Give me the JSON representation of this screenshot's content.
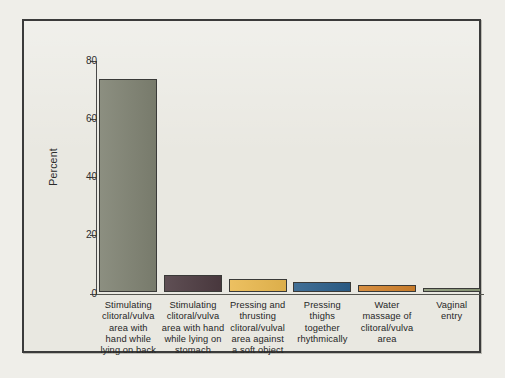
{
  "figure": {
    "frame_color": "#3b3b3b",
    "plot_background": "#e9e8e1"
  },
  "axis": {
    "y_title": "Percent",
    "y_ticks": [
      "0",
      "20",
      "40",
      "60",
      "80"
    ]
  },
  "chart_data": {
    "type": "bar",
    "title": "",
    "subtitle": "",
    "xlabel": "",
    "ylabel": "Percent",
    "ylim": [
      0,
      80
    ],
    "yticks": [
      0,
      20,
      40,
      60,
      80
    ],
    "grid": false,
    "legend": "none",
    "categories": [
      "Stimulating clitoral/vulva area with hand while lying on back",
      "Stimulating clitoral/vulva area with hand while lying on stomach",
      "Pressing and thrusting clitoral/vulval area against a soft object",
      "Pressing thighs together rhythmically",
      "Water massage of clitoral/vulva area",
      "Vaginal entry"
    ],
    "category_lines": [
      [
        "Stimulating",
        "clitoral/vulva",
        "area with",
        "hand while",
        "lying on back"
      ],
      [
        "Stimulating",
        "clitoral/vulva",
        "area with hand",
        "while lying on",
        "stomach"
      ],
      [
        "Pressing and",
        "thrusting",
        "clitoral/vulval",
        "area against",
        "a soft object"
      ],
      [
        "Pressing",
        "thighs",
        "together",
        "rhythmically"
      ],
      [
        "Water",
        "massage of",
        "clitoral/vulva",
        "area"
      ],
      [
        "Vaginal",
        "entry"
      ]
    ],
    "values": [
      73,
      6,
      4.5,
      3.5,
      2.5,
      1.5
    ],
    "colors": [
      "#7f8272",
      "#4d3b41",
      "#eab94f",
      "#2c5f8a",
      "#d2822c",
      "#8a9777"
    ]
  }
}
